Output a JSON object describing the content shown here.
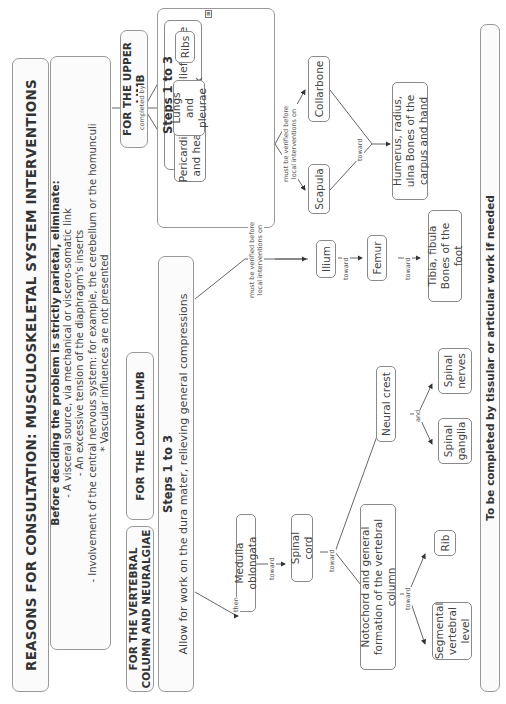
{
  "title": "REASONS FOR CONSULTATION: MUSCULOSKELETAL SYSTEM INTERVENTIONS",
  "intro": {
    "heading": "Before deciding the problem is strictly parietal, eliminate:",
    "lines": [
      "- A visceral source, via mechanical or viscero-somatic link",
      "- An excessive tension of the diaphragm's inserts",
      "- Involvement of the central nervous system: for example, the cerebellum or the homunculi",
      "* Vascular influences are not presented"
    ]
  },
  "sections": {
    "vertebral": "FOR THE VERTEBRAL COLUMN AND NEURALGIAE",
    "lower_limb": "FOR THE LOWER LIMB",
    "upper_limb": "FOR THE UPPER LIMB"
  },
  "vertebral_steps": {
    "heading": "Steps 1 to 3",
    "text": "Allow for work on the dura mater, relieving general compressions"
  },
  "upper_steps": {
    "heading": "Steps 1 to 3",
    "text": "Allow for the relief of the thorax"
  },
  "nodes": {
    "medulla": "Medulla oblongata",
    "spinal_cord": "Spinal cord",
    "notochord": "Notochord and general formation of the vertebral column",
    "segmental": "Segmental vertebral level",
    "rib": "Rib",
    "neural_crest": "Neural crest",
    "spinal_ganglia": "Spinal ganglia",
    "spinal_nerves": "Spinal nerves",
    "ilium": "Ilium",
    "femur": "Femur",
    "tibia": "Tibia, fibula Bones of the foot",
    "pericardium": "Pericardium and heart",
    "lungs": "Lungs and pleurae",
    "ribs": "Ribs",
    "scapula": "Scapula",
    "collarbone": "Collarbone",
    "humerus": "Humerus, radius, ulna Bones of the carpus and hand"
  },
  "edge_labels": {
    "then": "then",
    "toward": "toward",
    "and": "and",
    "completed_by": "completed by",
    "must_verify": "must be verified before local interventions on"
  },
  "footer": "To be completed by tissular or articular work if needed",
  "icons": {
    "collapse": "collapse-icon"
  },
  "colors": {
    "border": "#8a8a8a",
    "text": "#333333",
    "background": "#ffffff"
  }
}
